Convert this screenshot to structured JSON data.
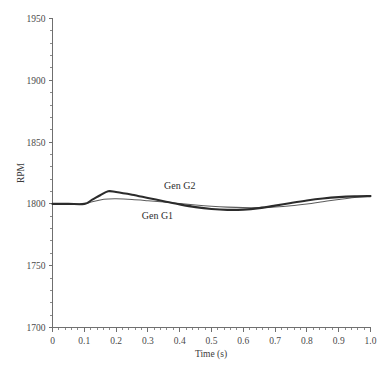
{
  "chart_data": {
    "type": "line",
    "title": "",
    "xlabel": "Time (s)",
    "ylabel": "RPM",
    "xlim": [
      0,
      1.0
    ],
    "ylim": [
      1700,
      1950
    ],
    "grid": false,
    "legend_position": "inline-annotation",
    "x_ticks": [
      "0",
      "0.1",
      "0.2",
      "0.3",
      "0.4",
      "0.5",
      "0.6",
      "0.7",
      "0.8",
      "0.9",
      "1.0"
    ],
    "x_tick_values": [
      0,
      0.1,
      0.2,
      0.3,
      0.4,
      0.5,
      0.6,
      0.7,
      0.8,
      0.9,
      1.0
    ],
    "x_minor_step": 0.02,
    "y_ticks": [
      "1700",
      "1750",
      "1800",
      "1850",
      "1900",
      "1950"
    ],
    "y_tick_values": [
      1700,
      1750,
      1800,
      1850,
      1900,
      1950
    ],
    "y_minor_step": 10,
    "x": [
      0.0,
      0.05,
      0.1,
      0.125,
      0.15,
      0.175,
      0.2,
      0.25,
      0.3,
      0.35,
      0.4,
      0.45,
      0.5,
      0.55,
      0.6,
      0.65,
      0.7,
      0.75,
      0.8,
      0.85,
      0.9,
      0.95,
      1.0
    ],
    "series": [
      {
        "name": "Gen G2",
        "style": "thick",
        "color": "#2b2b2b",
        "values": [
          1800.0,
          1800.0,
          1800.0,
          1803.4,
          1807.0,
          1810.2,
          1809.6,
          1807.4,
          1804.8,
          1802.2,
          1799.6,
          1797.4,
          1795.9,
          1795.2,
          1795.4,
          1796.6,
          1798.6,
          1800.8,
          1802.8,
          1804.4,
          1805.5,
          1806.1,
          1806.3
        ]
      },
      {
        "name": "Gen G1",
        "style": "thin",
        "color": "#5c5c5c",
        "values": [
          1800.0,
          1800.0,
          1800.0,
          1801.8,
          1803.2,
          1803.9,
          1804.1,
          1803.6,
          1802.6,
          1801.5,
          1800.3,
          1799.1,
          1798.1,
          1797.4,
          1797.0,
          1797.0,
          1797.5,
          1798.5,
          1800.0,
          1801.8,
          1803.6,
          1805.2,
          1806.3
        ]
      }
    ],
    "annotations": [
      {
        "text": "Gen G2",
        "x": 0.4,
        "y": 1812.0,
        "name": "series-label-gen-g2"
      },
      {
        "text": "Gen G1",
        "x": 0.33,
        "y": 1787.5,
        "name": "series-label-gen-g1"
      }
    ]
  }
}
